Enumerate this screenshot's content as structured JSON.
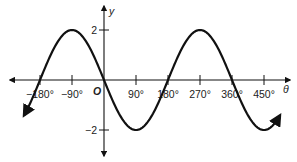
{
  "chart_data": {
    "type": "line",
    "title": "",
    "function": "y = -2 sin θ",
    "xlabel": "θ",
    "ylabel": "y",
    "origin_label": "O",
    "x_ticks": [
      -180,
      -90,
      90,
      180,
      270,
      360,
      450
    ],
    "x_tick_labels": [
      "−180°",
      "−90°",
      "90°",
      "180°",
      "270°",
      "360°",
      "450°"
    ],
    "y_ticks": [
      2,
      -2
    ],
    "y_tick_labels": [
      "2",
      "−2"
    ],
    "xlim": [
      -300,
      520
    ],
    "ylim": [
      -3,
      3
    ],
    "grid": false,
    "legend": null,
    "series": [
      {
        "name": "y = -2 sin θ",
        "x": [
          -225,
          -180,
          -135,
          -90,
          -45,
          0,
          45,
          90,
          135,
          180,
          225,
          270,
          315,
          360,
          405,
          450,
          495
        ],
        "values": [
          -1.41,
          0,
          1.41,
          2,
          1.41,
          0,
          -1.41,
          -2,
          -1.41,
          0,
          1.41,
          2,
          1.41,
          0,
          -1.41,
          -2,
          -1.41
        ]
      }
    ],
    "key_points": {
      "maxima": [
        [
          -90,
          2
        ],
        [
          270,
          2
        ]
      ],
      "minima": [
        [
          90,
          -2
        ],
        [
          450,
          -2
        ]
      ],
      "zeros": [
        -180,
        0,
        180,
        360
      ]
    },
    "curve_range": [
      -225,
      495
    ],
    "color": "#111111"
  }
}
